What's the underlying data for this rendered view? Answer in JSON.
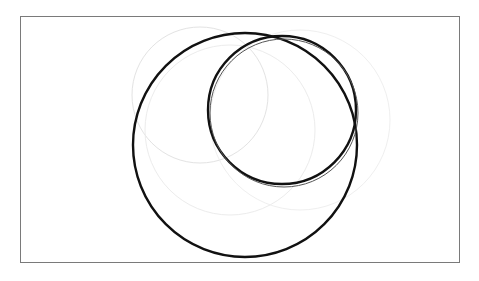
{
  "diagram": {
    "type": "overlapping-circles",
    "frame": {
      "x": 20,
      "y": 16,
      "width": 440,
      "height": 247,
      "stroke": "#7a7a7a"
    },
    "circles": [
      {
        "id": "large-circle",
        "cx": 245,
        "cy": 145,
        "r": 112,
        "stroke": "#111111",
        "width": 2.4
      },
      {
        "id": "small-circle",
        "cx": 282,
        "cy": 110,
        "r": 74,
        "stroke": "#111111",
        "width": 2.4
      },
      {
        "id": "small-circle-ghost",
        "cx": 284,
        "cy": 113,
        "r": 74,
        "stroke": "#555555",
        "width": 1
      }
    ],
    "faint_circles": [
      {
        "id": "faint-left",
        "cx": 200,
        "cy": 95,
        "r": 68,
        "stroke": "#e3e3e3"
      },
      {
        "id": "faint-lower",
        "cx": 230,
        "cy": 130,
        "r": 85,
        "stroke": "#ececec"
      },
      {
        "id": "faint-right",
        "cx": 300,
        "cy": 120,
        "r": 90,
        "stroke": "#efefef"
      }
    ]
  }
}
